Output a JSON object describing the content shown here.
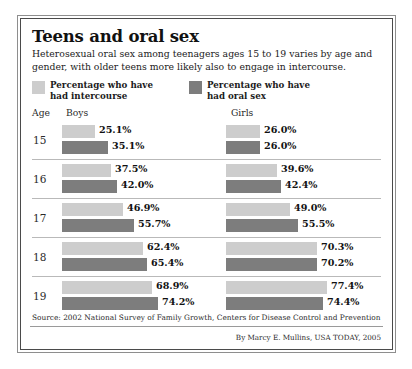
{
  "header": {
    "title": "Teens and oral sex",
    "subtitle": "Heterosexual oral sex among teenagers ages 15 to 19 varies by age and gender, with older teens more likely also to engage in intercourse."
  },
  "legend": {
    "items": [
      {
        "label": "Percentage who have had intercourse",
        "color": "#cdcdcd",
        "key": "intercourse"
      },
      {
        "label": "Percentage who have had oral sex",
        "color": "#7d7d7d",
        "key": "oral_sex"
      }
    ]
  },
  "columns": {
    "age": "Age",
    "boys": "Boys",
    "girls": "Girls"
  },
  "footer": {
    "source": "Source: 2002 National Survey of Family Growth, Centers for Disease Control and Prevention",
    "credit": "By Marcy E. Mullins, USA TODAY, 2005"
  },
  "chart_data": {
    "type": "bar",
    "title": "Teens and oral sex",
    "subtitle": "Heterosexual oral sex among teenagers ages 15 to 19 varies by age and gender, with older teens more likely also to engage in intercourse.",
    "orientation": "horizontal",
    "categories": [
      "15",
      "16",
      "17",
      "18",
      "19"
    ],
    "xlabel": "",
    "ylabel": "Age",
    "xlim": [
      0,
      100
    ],
    "units": "percent",
    "grid": false,
    "legend_position": "top",
    "groups": [
      "Boys",
      "Girls"
    ],
    "series": [
      {
        "name": "Percentage who have had intercourse",
        "group": "Boys",
        "color": "#cdcdcd",
        "values": [
          25.1,
          37.5,
          46.9,
          62.4,
          68.9
        ],
        "labels": [
          "25.1%",
          "37.5%",
          "46.9%",
          "62.4%",
          "68.9%"
        ]
      },
      {
        "name": "Percentage who have had oral sex",
        "group": "Boys",
        "color": "#7d7d7d",
        "values": [
          35.1,
          42.0,
          55.7,
          65.4,
          74.2
        ],
        "labels": [
          "35.1%",
          "42.0%",
          "55.7%",
          "65.4%",
          "74.2%"
        ]
      },
      {
        "name": "Percentage who have had intercourse",
        "group": "Girls",
        "color": "#cdcdcd",
        "values": [
          26.0,
          39.6,
          49.0,
          70.3,
          77.4
        ],
        "labels": [
          "26.0%",
          "39.6%",
          "49.0%",
          "70.3%",
          "77.4%"
        ]
      },
      {
        "name": "Percentage who have had oral sex",
        "group": "Girls",
        "color": "#7d7d7d",
        "values": [
          26.0,
          42.4,
          55.5,
          70.2,
          74.4
        ],
        "labels": [
          "26.0%",
          "42.4%",
          "55.5%",
          "70.2%",
          "74.4%"
        ]
      }
    ],
    "source": "Source: 2002 National Survey of Family Growth, Centers for Disease Control and Prevention",
    "credit": "By Marcy E. Mullins, USA TODAY, 2005"
  }
}
